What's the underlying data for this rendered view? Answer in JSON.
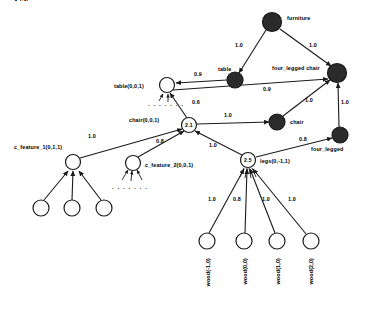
{
  "diagram": {
    "colors": {
      "filled_node": "#2b2b2b",
      "open_node": "#ffffff",
      "stroke": "#1a1a1a",
      "background": "#ffffff"
    },
    "nodes": [
      {
        "id": "furniture",
        "label": "furniture",
        "inner": "",
        "type": "filled",
        "cx": 272,
        "cy": 22,
        "r": 9.5,
        "label_x": 287,
        "label_y": 20,
        "label_anchor": "start"
      },
      {
        "id": "four_legged_chair",
        "label": "four_legged chair",
        "inner": "",
        "type": "filled",
        "cx": 337,
        "cy": 73,
        "r": 9.5,
        "label_x": 272,
        "label_y": 70,
        "label_anchor": "start"
      },
      {
        "id": "table_concept",
        "label": "table",
        "inner": "",
        "type": "filled",
        "cx": 235,
        "cy": 80,
        "r": 8.0,
        "label_x": 218,
        "label_y": 71,
        "label_anchor": "start"
      },
      {
        "id": "chair_concept",
        "label": "chair",
        "inner": "",
        "type": "filled",
        "cx": 277,
        "cy": 122,
        "r": 8.0,
        "label_x": 290,
        "label_y": 124,
        "label_anchor": "start"
      },
      {
        "id": "four_legged",
        "label": "four_legged",
        "inner": "",
        "type": "filled",
        "cx": 340,
        "cy": 135,
        "r": 8.0,
        "label_x": 311,
        "label_y": 151,
        "label_anchor": "start"
      },
      {
        "id": "table_node",
        "label": "table(0,0,1)",
        "inner": "",
        "type": "open",
        "cx": 167,
        "cy": 85,
        "r": 7.5,
        "label_x": 114,
        "label_y": 88,
        "label_anchor": "start"
      },
      {
        "id": "chair_node",
        "label": "chair(0,0,1)",
        "inner": "2.1",
        "type": "open",
        "cx": 189,
        "cy": 125,
        "r": 7.5,
        "label_x": 129,
        "label_y": 122,
        "label_anchor": "start"
      },
      {
        "id": "legs_node",
        "label": "legs(0,-1,1)",
        "inner": "2.5",
        "type": "open",
        "cx": 248,
        "cy": 160,
        "r": 7.5,
        "label_x": 260,
        "label_y": 163,
        "label_anchor": "start"
      },
      {
        "id": "c_feature_1",
        "label": "c_feature_1(0,1,1)",
        "inner": "",
        "type": "open",
        "cx": 73,
        "cy": 162,
        "r": 7.5,
        "label_x": 14,
        "label_y": 149,
        "label_anchor": "start"
      },
      {
        "id": "c_feature_2",
        "label": "c_feature_2(0,0,1)",
        "inner": "",
        "type": "open",
        "cx": 133,
        "cy": 163,
        "r": 7.5,
        "label_x": 145,
        "label_y": 167,
        "label_anchor": "start"
      },
      {
        "id": "cf1_child_1",
        "label": "",
        "inner": "",
        "type": "open",
        "cx": 41,
        "cy": 208,
        "r": 8.0,
        "label_x": 0,
        "label_y": 0,
        "label_anchor": "start"
      },
      {
        "id": "cf1_child_2",
        "label": "",
        "inner": "",
        "type": "open",
        "cx": 72,
        "cy": 208,
        "r": 8.0,
        "label_x": 0,
        "label_y": 0,
        "label_anchor": "start"
      },
      {
        "id": "cf1_child_3",
        "label": "",
        "inner": "",
        "type": "open",
        "cx": 104,
        "cy": 208,
        "r": 8.0,
        "label_x": 0,
        "label_y": 0,
        "label_anchor": "start"
      },
      {
        "id": "wood_m1",
        "label": "wood(-1,0)",
        "inner": "",
        "type": "open",
        "cx": 207,
        "cy": 241,
        "r": 8.0,
        "label_x": 0,
        "label_y": 0,
        "label_anchor": "start"
      },
      {
        "id": "wood_0",
        "label": "wood(0,0)",
        "inner": "",
        "type": "open",
        "cx": 244,
        "cy": 241,
        "r": 8.0,
        "label_x": 0,
        "label_y": 0,
        "label_anchor": "start"
      },
      {
        "id": "wood_1",
        "label": "wood(1,0)",
        "inner": "",
        "type": "open",
        "cx": 277,
        "cy": 241,
        "r": 8.0,
        "label_x": 0,
        "label_y": 0,
        "label_anchor": "start"
      },
      {
        "id": "wood_2",
        "label": "wood(2,0)",
        "inner": "",
        "type": "open",
        "cx": 311,
        "cy": 241,
        "r": 8.0,
        "label_x": 0,
        "label_y": 0,
        "label_anchor": "start"
      }
    ],
    "vertical_labels": [
      {
        "id": "wood_m1_label",
        "text": "wood(-1,0)",
        "x": 210,
        "y": 258
      },
      {
        "id": "wood_0_label",
        "text": "wood(0,0)",
        "x": 247,
        "y": 258
      },
      {
        "id": "wood_1_label",
        "text": "wood(1,0)",
        "x": 280,
        "y": 258
      },
      {
        "id": "wood_2_label",
        "text": "wood(2,0)",
        "x": 313,
        "y": 258
      }
    ],
    "edges": [
      {
        "id": "e-furniture-table",
        "from": "furniture",
        "to": "table_concept",
        "weight": "1.0",
        "wx": 239,
        "wy": 47
      },
      {
        "id": "e-furniture-fourleggedchair",
        "from": "furniture",
        "to": "four_legged_chair",
        "weight": "1.0",
        "wx": 313,
        "wy": 47
      },
      {
        "id": "e-tablenode-tableconcept",
        "from": "table_node",
        "to": "table_concept",
        "weight": "0.9",
        "wx": 198,
        "wy": 76
      },
      {
        "id": "e-tablenode-flchair",
        "from": "table_node",
        "to": "four_legged_chair",
        "weight": "0.9",
        "wx": 267,
        "wy": 91
      },
      {
        "id": "e-chairnode-tablenode",
        "from": "chair_node",
        "to": "table_node",
        "weight": "0.6",
        "wx": 196,
        "wy": 104
      },
      {
        "id": "e-chairnode-chairconcept",
        "from": "chair_node",
        "to": "chair_concept",
        "weight": "1.0",
        "wx": 228,
        "wy": 117
      },
      {
        "id": "e-chairconcept-flchair",
        "from": "chair_concept",
        "to": "four_legged_chair",
        "weight": "1.0",
        "wx": 309,
        "wy": 102
      },
      {
        "id": "e-fourlegged-flchair",
        "from": "four_legged",
        "to": "four_legged_chair",
        "weight": "1.0",
        "wx": 345,
        "wy": 104
      },
      {
        "id": "e-cf1-chairnode",
        "from": "c_feature_1",
        "to": "chair_node",
        "weight": "1.0",
        "wx": 92,
        "wy": 138
      },
      {
        "id": "e-cf2-chairnode",
        "from": "c_feature_2",
        "to": "chair_node",
        "weight": "0.8",
        "wx": 160,
        "wy": 143
      },
      {
        "id": "e-legs-chairnode",
        "from": "legs_node",
        "to": "chair_node",
        "weight": "1.0",
        "wx": 213,
        "wy": 147
      },
      {
        "id": "e-legs-fourlegged",
        "from": "legs_node",
        "to": "four_legged",
        "weight": "0.8",
        "wx": 303,
        "wy": 141
      },
      {
        "id": "e-woodm1-legs",
        "from": "wood_m1",
        "to": "legs_node",
        "weight": "1.0",
        "wx": 212,
        "wy": 201
      },
      {
        "id": "e-wood0-legs",
        "from": "wood_0",
        "to": "legs_node",
        "weight": "0.8",
        "wx": 237,
        "wy": 201
      },
      {
        "id": "e-wood1-legs",
        "from": "wood_1",
        "to": "legs_node",
        "weight": "1.0",
        "wx": 266,
        "wy": 201
      },
      {
        "id": "e-wood2-legs",
        "from": "wood_2",
        "to": "legs_node",
        "weight": "1.0",
        "wx": 292,
        "wy": 201
      },
      {
        "id": "e-cf1child1-cf1",
        "from": "cf1_child_1",
        "to": "c_feature_1",
        "weight": "",
        "wx": 0,
        "wy": 0
      },
      {
        "id": "e-cf1child2-cf1",
        "from": "cf1_child_2",
        "to": "c_feature_1",
        "weight": "",
        "wx": 0,
        "wy": 0
      },
      {
        "id": "e-cf1child3-cf1",
        "from": "cf1_child_3",
        "to": "c_feature_1",
        "weight": "",
        "wx": 0,
        "wy": 0
      }
    ],
    "ellipses": [
      {
        "id": "table-ellipsis",
        "text": ". . . . . . .",
        "x": 148,
        "y": 106
      },
      {
        "id": "cfeature2-ellipsis",
        "text": ". . . . . . .",
        "x": 112,
        "y": 189
      }
    ]
  }
}
